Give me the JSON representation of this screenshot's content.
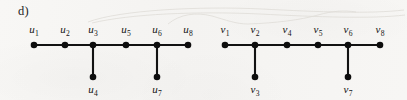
{
  "figure": {
    "part_label": "d)",
    "background_color": "#f6f5f3",
    "ink_color": "#121212"
  },
  "graphs": [
    {
      "id": "graph-u",
      "name": "left-graph",
      "vertex_prefix": "u",
      "spine": [
        {
          "id": "u1",
          "base": "u",
          "sub": "1",
          "label": "u₁",
          "cx": 34,
          "cy": 45,
          "label_x": 34,
          "label_y": 33
        },
        {
          "id": "u2",
          "base": "u",
          "sub": "2",
          "label": "u₂",
          "cx": 65,
          "cy": 45,
          "label_x": 65,
          "label_y": 33
        },
        {
          "id": "u3",
          "base": "u",
          "sub": "3",
          "label": "u₃",
          "cx": 93,
          "cy": 45,
          "label_x": 93,
          "label_y": 33
        },
        {
          "id": "u5",
          "base": "u",
          "sub": "5",
          "label": "u₅",
          "cx": 126,
          "cy": 45,
          "label_x": 126,
          "label_y": 33
        },
        {
          "id": "u6",
          "base": "u",
          "sub": "6",
          "label": "u₆",
          "cx": 157,
          "cy": 45,
          "label_x": 157,
          "label_y": 33
        },
        {
          "id": "u8",
          "base": "u",
          "sub": "8",
          "label": "u₈",
          "cx": 188,
          "cy": 45,
          "label_x": 188,
          "label_y": 33
        }
      ],
      "pendants": [
        {
          "id": "u4",
          "base": "u",
          "sub": "4",
          "label": "u₄",
          "cx": 93,
          "cy": 77,
          "parent": "u3",
          "label_x": 93,
          "label_y": 93
        },
        {
          "id": "u7",
          "base": "u",
          "sub": "7",
          "label": "u₇",
          "cx": 157,
          "cy": 77,
          "parent": "u6",
          "label_x": 157,
          "label_y": 93
        }
      ],
      "edges": [
        {
          "from": "u1",
          "to": "u2"
        },
        {
          "from": "u2",
          "to": "u3"
        },
        {
          "from": "u3",
          "to": "u5"
        },
        {
          "from": "u5",
          "to": "u6"
        },
        {
          "from": "u6",
          "to": "u8"
        },
        {
          "from": "u3",
          "to": "u4"
        },
        {
          "from": "u6",
          "to": "u7"
        }
      ]
    },
    {
      "id": "graph-v",
      "name": "right-graph",
      "vertex_prefix": "v",
      "spine": [
        {
          "id": "v1",
          "base": "v",
          "sub": "1",
          "label": "v₁",
          "cx": 225,
          "cy": 45,
          "label_x": 225,
          "label_y": 33
        },
        {
          "id": "v2",
          "base": "v",
          "sub": "2",
          "label": "v₂",
          "cx": 255,
          "cy": 45,
          "label_x": 255,
          "label_y": 33
        },
        {
          "id": "v4",
          "base": "v",
          "sub": "4",
          "label": "v₄",
          "cx": 287,
          "cy": 45,
          "label_x": 287,
          "label_y": 33
        },
        {
          "id": "v5",
          "base": "v",
          "sub": "5",
          "label": "v₅",
          "cx": 318,
          "cy": 45,
          "label_x": 318,
          "label_y": 33
        },
        {
          "id": "v6",
          "base": "v",
          "sub": "6",
          "label": "v₆",
          "cx": 348,
          "cy": 45,
          "label_x": 348,
          "label_y": 33
        },
        {
          "id": "v8",
          "base": "v",
          "sub": "8",
          "label": "v₈",
          "cx": 380,
          "cy": 45,
          "label_x": 380,
          "label_y": 33
        }
      ],
      "pendants": [
        {
          "id": "v3",
          "base": "v",
          "sub": "3",
          "label": "v₃",
          "cx": 255,
          "cy": 77,
          "parent": "v2",
          "label_x": 255,
          "label_y": 93
        },
        {
          "id": "v7",
          "base": "v",
          "sub": "7",
          "label": "v₇",
          "cx": 348,
          "cy": 77,
          "parent": "v6",
          "label_x": 348,
          "label_y": 93
        }
      ],
      "edges": [
        {
          "from": "v1",
          "to": "v2"
        },
        {
          "from": "v2",
          "to": "v4"
        },
        {
          "from": "v4",
          "to": "v5"
        },
        {
          "from": "v5",
          "to": "v6"
        },
        {
          "from": "v6",
          "to": "v8"
        },
        {
          "from": "v2",
          "to": "v3"
        },
        {
          "from": "v6",
          "to": "v7"
        }
      ]
    }
  ],
  "scan_artifacts": [
    {
      "id": "artifact-1",
      "path": "M 88 22 C 120 10, 200 6, 262 9 C 320 12, 370 14, 404 10"
    },
    {
      "id": "artifact-2",
      "path": "M 92 23 C 130 14, 196 11, 260 14 C 318 17, 372 19, 405 15"
    },
    {
      "id": "artifact-3",
      "path": "M 168 24 C 180 14, 196 12, 212 16 C 226 20, 236 24, 248 24"
    },
    {
      "id": "artifact-4",
      "path": "M 248 24 C 276 23, 300 20, 318 15 C 332 11, 344 10, 356 12"
    }
  ]
}
